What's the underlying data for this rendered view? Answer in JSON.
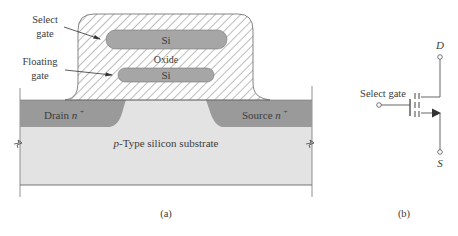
{
  "figure": {
    "panel_a": {
      "caption": "(a)",
      "labels": {
        "select_gate_line1": "Select",
        "select_gate_line2": "gate",
        "floating_gate_line1": "Floating",
        "floating_gate_line2": "gate",
        "select_gate_si": "Si",
        "floating_gate_si": "Si",
        "oxide": "Oxide",
        "drain": "Drain",
        "drain_doping": "n",
        "drain_sup": "+",
        "source": "Source",
        "source_doping": "n",
        "source_sup": "+",
        "substrate_prefix": "p",
        "substrate_rest": "-Type silicon substrate"
      },
      "colors": {
        "substrate": "#e3e3e3",
        "n_plus": "#9a9a9a",
        "si_gate": "#a6a6a6",
        "oxide_hatch": "#6a6a6a",
        "outline": "#555555"
      }
    },
    "panel_b": {
      "caption": "(b)",
      "labels": {
        "gate": "Select gate",
        "drain": "D",
        "source": "S"
      }
    }
  }
}
